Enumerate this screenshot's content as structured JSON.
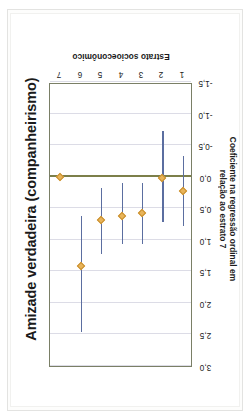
{
  "figure": {
    "title": "Amizade verdadeira (companheirismo)"
  },
  "chart_data": {
    "type": "scatter",
    "title": "Amizade verdadeira (companheirismo)",
    "subtitle": "",
    "orientation": "rotated-90-ccw",
    "xlabel": "Estrato socioeconômico",
    "ylabel_line1": "Coeficiente  na regressão ordinal em",
    "ylabel_line2": "relação ao estrato 7",
    "ylabel": "Coeficiente na regressão ordinal em relação ao estrato 7",
    "categories": [
      "1",
      "2",
      "3",
      "4",
      "5",
      "6",
      "7"
    ],
    "xticklabels": [
      "1",
      "2",
      "3",
      "4",
      "5",
      "6",
      "7"
    ],
    "yticklabels": [
      "3,0",
      "2,5",
      "2,0",
      "1,5",
      "1,0",
      "0,5",
      "0,0",
      "-0,5",
      "-1,0",
      "-1,5"
    ],
    "ytickvalues": [
      3.0,
      2.5,
      2.0,
      1.5,
      1.0,
      0.5,
      0.0,
      -0.5,
      -1.0,
      -1.5
    ],
    "ylim": [
      -1.5,
      3.0
    ],
    "grid": "value-axis-only",
    "legend": "none",
    "reference_line": 0.0,
    "values": [
      0.23,
      0.02,
      0.58,
      0.62,
      0.68,
      1.42,
      0.0
    ],
    "ci_low": [
      -0.33,
      -0.72,
      0.1,
      0.1,
      0.18,
      0.62,
      0.0
    ],
    "ci_high": [
      0.78,
      0.72,
      1.07,
      1.07,
      1.22,
      2.46,
      0.0
    ],
    "series": [
      {
        "name": "Coeficiente na regressão ordinal em relação ao estrato 7",
        "points": [
          {
            "category": "1",
            "value": 0.23,
            "ci_low": -0.33,
            "ci_high": 0.78
          },
          {
            "category": "2",
            "value": 0.02,
            "ci_low": -0.72,
            "ci_high": 0.72
          },
          {
            "category": "3",
            "value": 0.58,
            "ci_low": 0.1,
            "ci_high": 1.07
          },
          {
            "category": "4",
            "value": 0.62,
            "ci_low": 0.1,
            "ci_high": 1.07
          },
          {
            "category": "5",
            "value": 0.68,
            "ci_low": 0.18,
            "ci_high": 1.22
          },
          {
            "category": "6",
            "value": 1.42,
            "ci_low": 0.62,
            "ci_high": 2.46
          },
          {
            "category": "7",
            "value": 0.0,
            "ci_low": 0.0,
            "ci_high": 0.0
          }
        ]
      }
    ],
    "colors": {
      "marker": "#e8b45a",
      "interval": "#5b6ea0",
      "zero_line": "#7c7f4a",
      "grid": "#dcdce6",
      "axis": "#7a7f66",
      "text": "#1b1b1b",
      "background": "#ffffff"
    }
  }
}
